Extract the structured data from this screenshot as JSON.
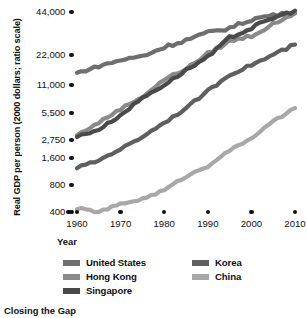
{
  "caption": "Closing the Gap",
  "axes": {
    "y_title": "Real GDP per person (2000 dollars; ratio scale)",
    "x_title": "Year",
    "y_ticks": [
      "44,000",
      "22,000",
      "11,000",
      "5,500",
      "2,750",
      "1,600",
      "800",
      "400"
    ],
    "x_ticks": [
      "1960",
      "1970",
      "1980",
      "1990",
      "2000",
      "2010"
    ]
  },
  "legend": {
    "left": [
      {
        "label": "United States",
        "color": "#6e6e6e"
      },
      {
        "label": "Hong Kong",
        "color": "#8a8a8a"
      },
      {
        "label": "Singapore",
        "color": "#4a4a4a"
      }
    ],
    "right": [
      {
        "label": "Korea",
        "color": "#5f5f5f"
      },
      {
        "label": "China",
        "color": "#a8a8a8"
      }
    ]
  },
  "colors": {
    "ink": "#111111",
    "background": "#ffffff",
    "united_states": "#6e6e6e",
    "hong_kong": "#8a8a8a",
    "singapore": "#4a4a4a",
    "korea": "#5f5f5f",
    "china": "#a8a8a8"
  },
  "chart_data": {
    "type": "line",
    "title": "Closing the Gap",
    "xlabel": "Year",
    "ylabel": "Real GDP per person (2000 dollars; ratio scale)",
    "scale": {
      "x": "linear",
      "y": "log"
    },
    "grid": false,
    "legend_position": "bottom",
    "xlim": [
      1960,
      2010
    ],
    "ylim": [
      400,
      44000
    ],
    "x_tick_values": [
      1960,
      1970,
      1980,
      1990,
      2000,
      2010
    ],
    "y_tick_values": [
      400,
      800,
      1600,
      2750,
      5500,
      11000,
      22000,
      44000
    ],
    "x": [
      1960,
      1965,
      1970,
      1975,
      1980,
      1985,
      1990,
      1995,
      2000,
      2005,
      2010
    ],
    "series": [
      {
        "name": "United States",
        "color": "#6e6e6e",
        "values": [
          14500,
          17000,
          19500,
          21500,
          25000,
          28000,
          31500,
          34000,
          39000,
          42000,
          43000
        ]
      },
      {
        "name": "Hong Kong",
        "color": "#8a8a8a",
        "values": [
          3100,
          4300,
          6100,
          8200,
          12500,
          16000,
          22500,
          27500,
          30000,
          36000,
          44000
        ]
      },
      {
        "name": "Singapore",
        "color": "#4a4a4a",
        "values": [
          3000,
          3600,
          5200,
          8000,
          11000,
          15500,
          21000,
          29000,
          34000,
          40000,
          45000
        ]
      },
      {
        "name": "Korea",
        "color": "#5f5f5f",
        "values": [
          1250,
          1500,
          2100,
          3000,
          4300,
          6200,
          9500,
          14000,
          17500,
          22000,
          26000
        ]
      },
      {
        "name": "China",
        "color": "#a8a8a8",
        "values": [
          440,
          400,
          490,
          560,
          700,
          1000,
          1300,
          2000,
          2900,
          4400,
          6200
        ]
      }
    ]
  }
}
